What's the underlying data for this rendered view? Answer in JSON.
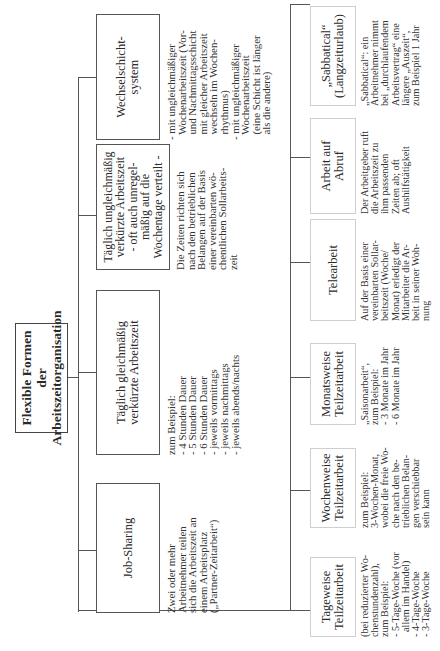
{
  "root": {
    "title": "Flexible Formen\nder\nArbeitszeitorganisation"
  },
  "top_row": [
    {
      "label": "Job-Sharing",
      "description": "Zwei oder mehr\nArbeitnehmer teilen\nsich die Arbeitszeit an\neinem Arbeitsplatz\n(„Partner-Zeitarbeit“)"
    },
    {
      "label": "Täglich gleichmäßig\nverkürzte Arbeitszeit",
      "description": "zum Beispiel:\n- 4 Stunden Dauer\n- 5 Stunden Dauer\n- 6 Stunden Dauer\n- jeweils vormittags\n- jeweils nachmittags\n- jeweils abends/nachts"
    },
    {
      "label": "Täglich ungleichmäßig\nverkürzte Arbeitszeit\n- oft auch unregel-\nmäßig auf die\nWochentage verteilt -",
      "description": "Die Zeiten richten sich\nnach den betrieblichen\nBelangen auf der Basis\neiner vereinbarten wö-\nchentlichen Sollarbeits-\nzeit"
    },
    {
      "label": "Wechselschicht-\nsystem",
      "description": "- mit ungleichmäßiger\n  Wochenarbeitszeit (Vor-\n  und Nachmittagsschicht\n  mit gleicher Arbeitszeit\n  wechseln im Wochen-\n  rhythmus)\n- mit ungleichmäßiger\n  Wochenarbeitszeit\n  (eine Schicht ist länger\n  als die andere)"
    }
  ],
  "bottom_row": [
    {
      "label": "Tageweise\nTeilzeitarbeit",
      "description": "(bei reduzierter Wo-\nchenstundenzahl),\nzum Beispiel:\n- 5-Tage-Woche (vor\n  allem im Handel)\n- 4-Tage-Woche\n- 3-Tage-Woche"
    },
    {
      "label": "Wochenweise\nTeilzeitarbeit",
      "description": "zum Beispiel:\n3-Wochen-Monat,\nwobei die freie Wo-\nche nach den be-\ntrieblichen Belan-\ngen verschiebbar\nsein kann"
    },
    {
      "label": "Monatsweise\nTeilzeitarbeit",
      "description": "„Saisonarbeit“,\nzum Beispiel:\n- 3 Monate im Jahr\n- 6 Monate im Jahr"
    },
    {
      "label": "Telearbeit",
      "description": "Auf der Basis einer\nvereinbarten Sollar-\nbeitszeit (Woche/\nMonat) erledigt der\nMitarbeiter die Ar-\nbeit in seiner Woh-\nnung"
    },
    {
      "label": "Arbeit auf\nAbruf",
      "description": "Der Arbeitgeber ruft\ndie Arbeitszeit zu\nihm passenden\nZeiten ab; oft\nAushilfstätigkeit"
    },
    {
      "label": "„Sabbatical“\n(Langzeiturlaub)",
      "description": "„Sabbatical“: ein\nArbeitnehmer nimmt\nbei „durchlaufendem\nArbeitsvertrag“ eine\nlängere „Auszeit“,\nzum Beispiel 1 Jahr"
    }
  ]
}
